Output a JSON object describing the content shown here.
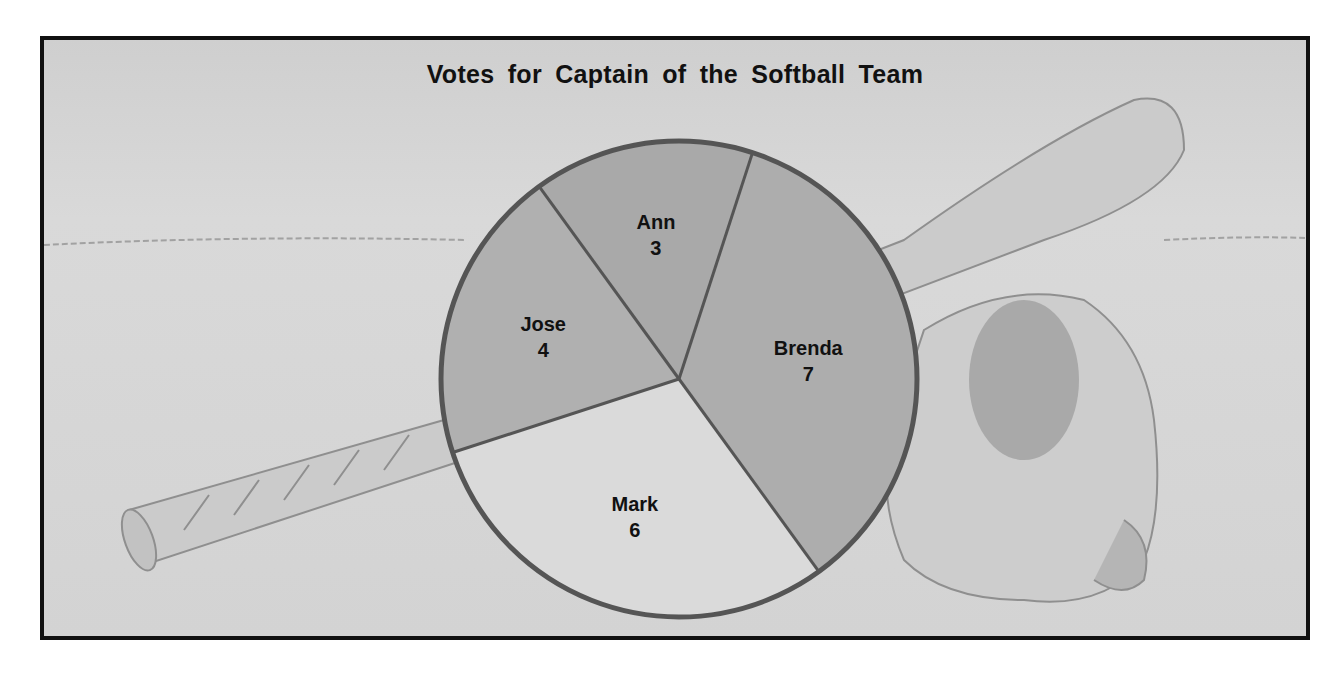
{
  "chart_data": {
    "type": "pie",
    "title": "Votes for Captain of the Softball Team",
    "categories": [
      "Ann",
      "Brenda",
      "Mark",
      "Jose"
    ],
    "values": [
      3,
      7,
      6,
      4
    ],
    "total": 20,
    "slices": [
      {
        "label": "Ann",
        "value": 3,
        "color": "#a9a9a9"
      },
      {
        "label": "Brenda",
        "value": 7,
        "color": "#adadad"
      },
      {
        "label": "Mark",
        "value": 6,
        "color": "#dadada"
      },
      {
        "label": "Jose",
        "value": 4,
        "color": "#b0b0b0"
      }
    ],
    "start_angle_deg": -36,
    "legend": "none (labels inside slices)",
    "background": "illustration of softball bat and glove"
  },
  "colors": {
    "frame_border": "#111111",
    "pie_outline": "#555555",
    "background": "#d7d7d7"
  }
}
